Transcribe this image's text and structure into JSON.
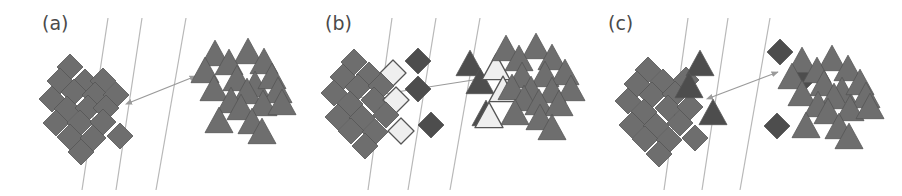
{
  "figure": {
    "width": 902,
    "height": 196,
    "background": "#ffffff"
  },
  "colors": {
    "shape_fill": "#6e6e6e",
    "shape_fill_dark": "#4d4d4d",
    "shape_fill_hollow": "#efefef",
    "shape_stroke": "#555555",
    "hyperplane_line": "#b8b8b8",
    "margin_arrow": "#9a9a9a",
    "label_text": "#4a4a4a",
    "background": "#ffffff"
  },
  "panels": [
    {
      "id": "panel-a",
      "label": "(a)",
      "label_x": 42,
      "label_y": 14,
      "x_offset": 0,
      "width": 300,
      "boundaries": [
        {
          "name": "margin-line-left",
          "x1": 108,
          "y1": 18,
          "x2": 82,
          "y2": 190
        },
        {
          "name": "decision-boundary",
          "x1": 142,
          "y1": 18,
          "x2": 116,
          "y2": 190
        },
        {
          "name": "margin-line-right",
          "x1": 186,
          "y1": 18,
          "x2": 156,
          "y2": 190
        }
      ],
      "margin_arrow": {
        "name": "margin-width-arrow",
        "x1": 131,
        "y1": 102,
        "x2": 196,
        "y2": 76,
        "double_headed": true
      },
      "diamonds": [
        {
          "x": 70,
          "y": 67,
          "s": 13,
          "style": "solid"
        },
        {
          "x": 60,
          "y": 81,
          "s": 13,
          "style": "solid"
        },
        {
          "x": 85,
          "y": 82,
          "s": 13,
          "style": "solid"
        },
        {
          "x": 103,
          "y": 81,
          "s": 13,
          "style": "solid"
        },
        {
          "x": 74,
          "y": 92,
          "s": 13,
          "style": "solid"
        },
        {
          "x": 95,
          "y": 95,
          "s": 13,
          "style": "solid"
        },
        {
          "x": 52,
          "y": 99,
          "s": 13,
          "style": "solid"
        },
        {
          "x": 116,
          "y": 95,
          "s": 13,
          "style": "solid"
        },
        {
          "x": 67,
          "y": 109,
          "s": 13,
          "style": "solid"
        },
        {
          "x": 88,
          "y": 108,
          "s": 13,
          "style": "solid"
        },
        {
          "x": 106,
          "y": 108,
          "s": 13,
          "style": "solid"
        },
        {
          "x": 56,
          "y": 123,
          "s": 13,
          "style": "solid"
        },
        {
          "x": 80,
          "y": 123,
          "s": 13,
          "style": "solid"
        },
        {
          "x": 103,
          "y": 122,
          "s": 13,
          "style": "solid"
        },
        {
          "x": 70,
          "y": 137,
          "s": 13,
          "style": "solid"
        },
        {
          "x": 93,
          "y": 138,
          "s": 13,
          "style": "solid"
        },
        {
          "x": 120,
          "y": 136,
          "s": 13,
          "style": "solid"
        },
        {
          "x": 81,
          "y": 152,
          "s": 13,
          "style": "solid"
        }
      ],
      "triangles": [
        {
          "x": 215,
          "y": 55,
          "s": 14,
          "style": "solid"
        },
        {
          "x": 248,
          "y": 53,
          "s": 14,
          "style": "solid"
        },
        {
          "x": 229,
          "y": 64,
          "s": 14,
          "style": "solid"
        },
        {
          "x": 264,
          "y": 63,
          "s": 14,
          "style": "solid"
        },
        {
          "x": 205,
          "y": 72,
          "s": 14,
          "style": "solid"
        },
        {
          "x": 237,
          "y": 80,
          "s": 14,
          "style": "solid"
        },
        {
          "x": 255,
          "y": 86,
          "s": 14,
          "style": "solid"
        },
        {
          "x": 272,
          "y": 78,
          "s": 14,
          "style": "solid"
        },
        {
          "x": 214,
          "y": 90,
          "s": 14,
          "style": "solid"
        },
        {
          "x": 247,
          "y": 93,
          "s": 14,
          "style": "solid"
        },
        {
          "x": 278,
          "y": 92,
          "s": 14,
          "style": "solid"
        },
        {
          "x": 231,
          "y": 102,
          "s": 14,
          "style": "solid"
        },
        {
          "x": 263,
          "y": 105,
          "s": 14,
          "style": "solid"
        },
        {
          "x": 282,
          "y": 104,
          "s": 14,
          "style": "solid"
        },
        {
          "x": 241,
          "y": 109,
          "s": 14,
          "style": "solid"
        },
        {
          "x": 219,
          "y": 122,
          "s": 14,
          "style": "solid"
        },
        {
          "x": 252,
          "y": 123,
          "s": 14,
          "style": "solid"
        },
        {
          "x": 262,
          "y": 133,
          "s": 14,
          "style": "solid"
        }
      ]
    },
    {
      "id": "panel-b",
      "label": "(b)",
      "label_x": 325,
      "label_y": 14,
      "x_offset": 290,
      "width": 300,
      "boundaries": [
        {
          "name": "margin-line-left",
          "x1": 102,
          "y1": 18,
          "x2": 78,
          "y2": 190
        },
        {
          "name": "decision-boundary",
          "x1": 146,
          "y1": 18,
          "x2": 118,
          "y2": 190
        },
        {
          "name": "margin-line-right",
          "x1": 190,
          "y1": 18,
          "x2": 160,
          "y2": 190
        }
      ],
      "margin_arrow": {
        "name": "margin-width-arrow",
        "x1": 68,
        "y1": 98,
        "x2": 196,
        "y2": 78,
        "double_headed": false
      },
      "diamonds": [
        {
          "x": 64,
          "y": 62,
          "s": 13,
          "style": "solid"
        },
        {
          "x": 53,
          "y": 77,
          "s": 13,
          "style": "solid"
        },
        {
          "x": 79,
          "y": 75,
          "s": 13,
          "style": "solid"
        },
        {
          "x": 103,
          "y": 73,
          "s": 13,
          "style": "hollow"
        },
        {
          "x": 68,
          "y": 87,
          "s": 13,
          "style": "solid"
        },
        {
          "x": 91,
          "y": 86,
          "s": 13,
          "style": "solid"
        },
        {
          "x": 44,
          "y": 93,
          "s": 13,
          "style": "solid"
        },
        {
          "x": 60,
          "y": 104,
          "s": 13,
          "style": "solid"
        },
        {
          "x": 84,
          "y": 100,
          "s": 13,
          "style": "solid"
        },
        {
          "x": 106,
          "y": 100,
          "s": 13,
          "style": "hollow"
        },
        {
          "x": 48,
          "y": 117,
          "s": 13,
          "style": "solid"
        },
        {
          "x": 72,
          "y": 118,
          "s": 13,
          "style": "solid"
        },
        {
          "x": 96,
          "y": 115,
          "s": 13,
          "style": "solid"
        },
        {
          "x": 61,
          "y": 131,
          "s": 13,
          "style": "solid"
        },
        {
          "x": 85,
          "y": 132,
          "s": 13,
          "style": "solid"
        },
        {
          "x": 111,
          "y": 131,
          "s": 13,
          "style": "hollow"
        },
        {
          "x": 75,
          "y": 146,
          "s": 13,
          "style": "solid"
        },
        {
          "x": 128,
          "y": 61,
          "s": 13,
          "style": "dark"
        },
        {
          "x": 128,
          "y": 89,
          "s": 13,
          "style": "dark"
        },
        {
          "x": 141,
          "y": 125,
          "s": 13,
          "style": "dark"
        }
      ],
      "triangles": [
        {
          "x": 180,
          "y": 65,
          "s": 14,
          "style": "dark"
        },
        {
          "x": 190,
          "y": 83,
          "s": 14,
          "style": "dark"
        },
        {
          "x": 196,
          "y": 115,
          "s": 14,
          "style": "dark"
        },
        {
          "x": 206,
          "y": 69,
          "s": 14,
          "style": "hollow"
        },
        {
          "x": 213,
          "y": 91,
          "s": 14,
          "style": "hollow"
        },
        {
          "x": 199,
          "y": 117,
          "s": 14,
          "style": "hollow"
        },
        {
          "x": 216,
          "y": 50,
          "s": 14,
          "style": "solid"
        },
        {
          "x": 246,
          "y": 48,
          "s": 14,
          "style": "solid"
        },
        {
          "x": 229,
          "y": 60,
          "s": 14,
          "style": "solid"
        },
        {
          "x": 262,
          "y": 59,
          "s": 14,
          "style": "solid"
        },
        {
          "x": 232,
          "y": 77,
          "s": 14,
          "style": "solid"
        },
        {
          "x": 255,
          "y": 76,
          "s": 14,
          "style": "solid"
        },
        {
          "x": 275,
          "y": 74,
          "s": 14,
          "style": "solid"
        },
        {
          "x": 222,
          "y": 89,
          "s": 14,
          "style": "solid"
        },
        {
          "x": 241,
          "y": 91,
          "s": 14,
          "style": "solid"
        },
        {
          "x": 262,
          "y": 92,
          "s": 14,
          "style": "solid"
        },
        {
          "x": 281,
          "y": 90,
          "s": 14,
          "style": "solid"
        },
        {
          "x": 234,
          "y": 100,
          "s": 14,
          "style": "solid"
        },
        {
          "x": 249,
          "y": 104,
          "s": 14,
          "style": "solid"
        },
        {
          "x": 269,
          "y": 105,
          "s": 14,
          "style": "solid"
        },
        {
          "x": 225,
          "y": 114,
          "s": 14,
          "style": "solid"
        },
        {
          "x": 250,
          "y": 119,
          "s": 14,
          "style": "solid"
        },
        {
          "x": 262,
          "y": 129,
          "s": 14,
          "style": "solid"
        }
      ]
    },
    {
      "id": "panel-c",
      "label": "(c)",
      "label_x": 608,
      "label_y": 14,
      "x_offset": 590,
      "width": 312,
      "boundaries": [
        {
          "name": "margin-line-left",
          "x1": 98,
          "y1": 18,
          "x2": 74,
          "y2": 190
        },
        {
          "name": "decision-boundary",
          "x1": 138,
          "y1": 18,
          "x2": 112,
          "y2": 190
        },
        {
          "name": "margin-line-right",
          "x1": 180,
          "y1": 18,
          "x2": 150,
          "y2": 190
        }
      ],
      "margin_arrow": {
        "name": "margin-width-arrow",
        "x1": 122,
        "y1": 97,
        "x2": 188,
        "y2": 72,
        "double_headed": true
      },
      "diamonds": [
        {
          "x": 58,
          "y": 70,
          "s": 13,
          "style": "solid"
        },
        {
          "x": 47,
          "y": 84,
          "s": 13,
          "style": "solid"
        },
        {
          "x": 73,
          "y": 82,
          "s": 13,
          "style": "solid"
        },
        {
          "x": 96,
          "y": 80,
          "s": 13,
          "style": "solid"
        },
        {
          "x": 62,
          "y": 95,
          "s": 13,
          "style": "solid"
        },
        {
          "x": 85,
          "y": 94,
          "s": 13,
          "style": "solid"
        },
        {
          "x": 38,
          "y": 101,
          "s": 13,
          "style": "solid"
        },
        {
          "x": 54,
          "y": 112,
          "s": 13,
          "style": "solid"
        },
        {
          "x": 78,
          "y": 108,
          "s": 13,
          "style": "solid"
        },
        {
          "x": 100,
          "y": 107,
          "s": 13,
          "style": "solid"
        },
        {
          "x": 42,
          "y": 125,
          "s": 13,
          "style": "solid"
        },
        {
          "x": 66,
          "y": 126,
          "s": 13,
          "style": "solid"
        },
        {
          "x": 90,
          "y": 123,
          "s": 13,
          "style": "solid"
        },
        {
          "x": 55,
          "y": 139,
          "s": 13,
          "style": "solid"
        },
        {
          "x": 79,
          "y": 140,
          "s": 13,
          "style": "solid"
        },
        {
          "x": 105,
          "y": 138,
          "s": 13,
          "style": "solid"
        },
        {
          "x": 69,
          "y": 154,
          "s": 13,
          "style": "solid"
        },
        {
          "x": 190,
          "y": 52,
          "s": 13,
          "style": "dark"
        },
        {
          "x": 212,
          "y": 80,
          "s": 13,
          "style": "dark"
        },
        {
          "x": 187,
          "y": 126,
          "s": 13,
          "style": "dark"
        }
      ],
      "triangles": [
        {
          "x": 110,
          "y": 65,
          "s": 14,
          "style": "dark"
        },
        {
          "x": 99,
          "y": 87,
          "s": 14,
          "style": "dark"
        },
        {
          "x": 123,
          "y": 114,
          "s": 14,
          "style": "dark"
        },
        {
          "x": 212,
          "y": 62,
          "s": 14,
          "style": "solid"
        },
        {
          "x": 242,
          "y": 60,
          "s": 14,
          "style": "solid"
        },
        {
          "x": 227,
          "y": 72,
          "s": 14,
          "style": "solid"
        },
        {
          "x": 258,
          "y": 70,
          "s": 14,
          "style": "solid"
        },
        {
          "x": 202,
          "y": 78,
          "s": 14,
          "style": "solid"
        },
        {
          "x": 234,
          "y": 85,
          "s": 14,
          "style": "solid"
        },
        {
          "x": 252,
          "y": 92,
          "s": 14,
          "style": "solid"
        },
        {
          "x": 270,
          "y": 84,
          "s": 14,
          "style": "solid"
        },
        {
          "x": 212,
          "y": 95,
          "s": 14,
          "style": "solid"
        },
        {
          "x": 244,
          "y": 98,
          "s": 14,
          "style": "solid"
        },
        {
          "x": 276,
          "y": 97,
          "s": 14,
          "style": "solid"
        },
        {
          "x": 228,
          "y": 106,
          "s": 14,
          "style": "solid"
        },
        {
          "x": 260,
          "y": 110,
          "s": 14,
          "style": "solid"
        },
        {
          "x": 280,
          "y": 108,
          "s": 14,
          "style": "solid"
        },
        {
          "x": 238,
          "y": 113,
          "s": 14,
          "style": "solid"
        },
        {
          "x": 216,
          "y": 127,
          "s": 14,
          "style": "solid"
        },
        {
          "x": 249,
          "y": 128,
          "s": 14,
          "style": "solid"
        },
        {
          "x": 259,
          "y": 138,
          "s": 14,
          "style": "solid"
        }
      ]
    }
  ]
}
